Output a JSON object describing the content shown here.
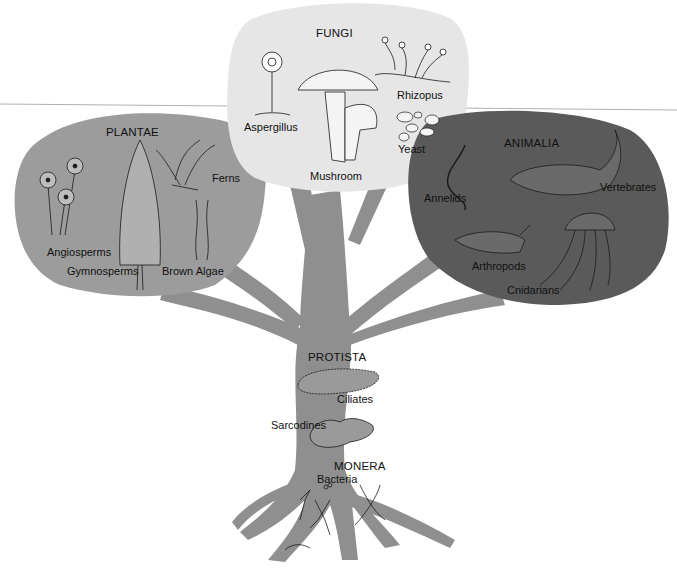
{
  "colors": {
    "trunk": "#8f8f8f",
    "plantae": "#9c9c9c",
    "fungi": "#e6e6e6",
    "animalia": "#5a5a5a",
    "ink": "#1a1a1a",
    "rule_line": "#aaaaaa"
  },
  "kingdoms": {
    "fungi": {
      "name": "FUNGI",
      "members": [
        "Aspergillus",
        "Mushroom",
        "Rhizopus",
        "Yeast"
      ]
    },
    "plantae": {
      "name": "PLANTAE",
      "members": [
        "Angiosperms",
        "Gymnosperms",
        "Ferns",
        "Brown Algae"
      ]
    },
    "animalia": {
      "name": "ANIMALIA",
      "members": [
        "Annelids",
        "Vertebrates",
        "Arthropods",
        "Cnidarians"
      ]
    },
    "protista": {
      "name": "PROTISTA",
      "members": [
        "Ciliates",
        "Sarcodines"
      ]
    },
    "monera": {
      "name": "MONERA",
      "members": [
        "Bacteria"
      ]
    }
  }
}
